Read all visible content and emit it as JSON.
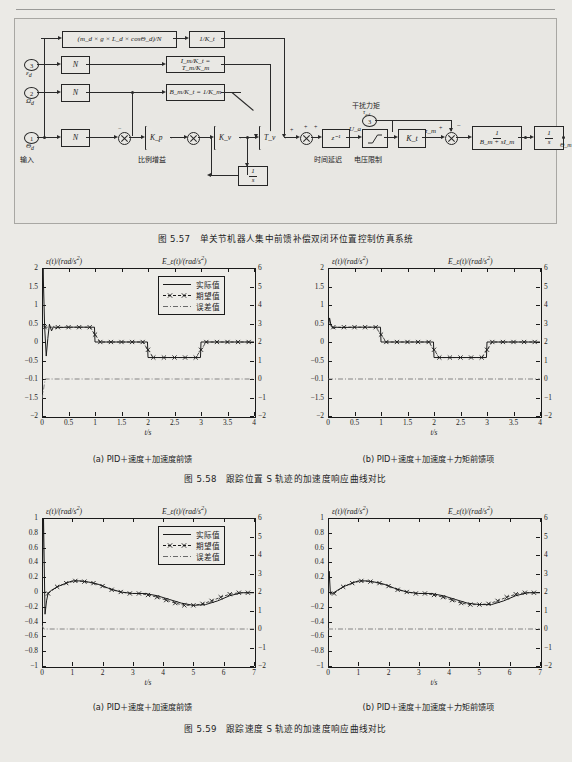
{
  "page": {
    "background": "#ebeae6",
    "ink": "#1d1d1d"
  },
  "block_diagram": {
    "caption": "图 5.57　单关节机器人集中前馈补偿双闭环位置控制仿真系统",
    "ports": [
      {
        "id": "3",
        "label": "ε_d"
      },
      {
        "id": "2",
        "label": "Ω_d"
      },
      {
        "id": "1",
        "label": "Θ_d"
      },
      {
        "id": "3b",
        "label": "τ_ed"
      },
      {
        "id": "1out",
        "label": "Θ"
      }
    ],
    "blocks": {
      "gravity": "(m_d × g × L_d × cosΘ_d)/N",
      "inv_kt_1": "1/K_t",
      "gear_n_1": "N",
      "gear_n_2": "N",
      "gear_n_3": "N",
      "inertia": "I_m/K_t = T_m/K_m",
      "damping": "B_m/K_t = 1/K_m",
      "delay": "z⁻¹",
      "saturation": "voltage-limit",
      "torque_const": "K_t",
      "motor_plant_num": "1",
      "motor_plant_den": "B_m + sI_m",
      "integrator_num": "1",
      "integrator_den": "s",
      "inner_integ_num": "1",
      "inner_integ_den": "s",
      "output_gear": "1/N",
      "gain_kp": "K_p",
      "gain_kv": "K_v",
      "gain_tv": "T_v"
    },
    "signal_labels": {
      "ua": "U_a",
      "tau_m": "τ_m",
      "theta_m": "Θ_m"
    },
    "annotations": {
      "proportional_gain": "比例增益",
      "time_delay": "时间延迟",
      "voltage_limit": "电压限制",
      "disturbance_torque": "干扰力矩",
      "input": "输入",
      "output": "输出"
    },
    "signs": {
      "plus": "+",
      "minus": "−"
    }
  },
  "figure_558": {
    "caption": "图 5.58　跟踪位置 S 轨迹的加速度响应曲线对比",
    "subcaptions": {
      "a": "(a) PID＋速度＋加速度前馈",
      "b": "(b) PID＋速度＋加速度＋力矩前馈项"
    },
    "legend": [
      "实际值",
      "期望值",
      "误差值"
    ]
  },
  "figure_559": {
    "caption": "图 5.59　跟踪速度 S 轨迹的加速度响应曲线对比",
    "subcaptions": {
      "a": "(a) PID＋速度＋加速度前馈",
      "b": "(b) PID＋速度＋加速度＋力矩前馈项"
    },
    "legend": [
      "实际值",
      "期望值",
      "误差值"
    ]
  },
  "chart_data": [
    {
      "id": "fig558a",
      "type": "line",
      "title": "(a) PID＋速度＋加速度前馈",
      "xlabel": "t/s",
      "ylabel": "ε(t)/(rad/s²)",
      "ylabel_right": "E_ε(t)/(rad/s²)",
      "xlim": [
        0,
        4
      ],
      "ylim": [
        -2,
        2
      ],
      "ylim_right": [
        -2,
        6
      ],
      "xticks": [
        0,
        0.5,
        1,
        1.5,
        2,
        2.5,
        3,
        3.5,
        4
      ],
      "xticklabels": [
        "0",
        "0.5",
        "1",
        "1.5",
        "2",
        "2.5",
        "3",
        "3.5",
        "4"
      ],
      "yticks": [
        -2,
        -1.5,
        -1,
        -0.5,
        0,
        0.5,
        1,
        1.5,
        2
      ],
      "yticklabels": [
        "−2",
        "−1.5",
        "−0.1",
        "−0.5",
        "0",
        "0.5",
        "1",
        "1.5",
        "2"
      ],
      "yticks_right": [
        -2,
        -1,
        0,
        1,
        2,
        3,
        4,
        5,
        6
      ],
      "yticklabels_right": [
        "−2",
        "−1",
        "0",
        "1",
        "2",
        "3",
        "4",
        "5",
        "6"
      ],
      "grid": false,
      "legend": [
        "实际值",
        "期望值",
        "误差值"
      ],
      "legend_position": "upper right",
      "series": [
        {
          "name": "实际值",
          "style": "solid",
          "x": [
            0,
            0.02,
            0.05,
            0.08,
            0.11,
            0.14,
            0.18,
            0.22,
            0.26,
            0.3,
            0.36,
            0.45,
            0.6,
            0.99,
            1.0,
            1.99,
            2.0,
            2.99,
            3.0,
            4.0
          ],
          "y": [
            0.38,
            2.0,
            0.4,
            -0.38,
            0.1,
            0.48,
            0.3,
            0.42,
            0.37,
            0.4,
            0.39,
            0.4,
            0.4,
            0.4,
            0.0,
            0.0,
            -0.42,
            -0.42,
            0.0,
            0.0
          ]
        },
        {
          "name": "期望值",
          "style": "dashed-marker",
          "x": [
            0.05,
            0.3,
            0.5,
            0.7,
            0.9,
            1.0,
            1.1,
            1.3,
            1.5,
            1.7,
            1.9,
            2.0,
            2.1,
            2.3,
            2.5,
            2.7,
            2.9,
            3.0,
            3.1,
            3.3,
            3.5,
            3.7,
            3.9
          ],
          "y": [
            0.4,
            0.4,
            0.4,
            0.4,
            0.4,
            0.2,
            0.0,
            0.0,
            0.0,
            0.0,
            0.0,
            -0.21,
            -0.42,
            -0.42,
            -0.42,
            -0.42,
            -0.42,
            -0.21,
            0.0,
            0.0,
            0.0,
            0.0,
            0.0
          ]
        },
        {
          "name": "误差值",
          "style": "dashdot",
          "x": [
            0,
            0.06,
            0.12,
            4.0
          ],
          "y": [
            -1.55,
            -1.0,
            -1.0,
            -1.0
          ]
        }
      ]
    },
    {
      "id": "fig558b",
      "type": "line",
      "title": "(b) PID＋速度＋加速度＋力矩前馈项",
      "xlabel": "t/s",
      "ylabel": "ε(t)/(rad/s²)",
      "ylabel_right": "E_ε(t)/(rad/s²)",
      "xlim": [
        0,
        4
      ],
      "ylim": [
        -2,
        2
      ],
      "ylim_right": [
        -2,
        6
      ],
      "xticks": [
        0,
        0.5,
        1,
        1.5,
        2,
        2.5,
        3,
        3.5,
        4
      ],
      "xticklabels": [
        "0",
        "0.5",
        "1",
        "1.5",
        "2",
        "2.5",
        "3",
        "3.5",
        "4"
      ],
      "yticks": [
        -2,
        -1.5,
        -1,
        -0.5,
        0,
        0.5,
        1,
        1.5,
        2
      ],
      "yticklabels": [
        "−2",
        "−1.5",
        "−0.1",
        "−0.5",
        "0",
        "0.5",
        "1",
        "1.5",
        "2"
      ],
      "yticks_right": [
        -2,
        -1,
        0,
        1,
        2,
        3,
        4,
        5,
        6
      ],
      "yticklabels_right": [
        "−2",
        "−1",
        "0",
        "1",
        "2",
        "3",
        "4",
        "5",
        "6"
      ],
      "grid": false,
      "legend": [],
      "series": [
        {
          "name": "实际值",
          "style": "solid",
          "x": [
            0,
            0.03,
            0.06,
            0.1,
            0.15,
            0.25,
            0.5,
            0.99,
            1.0,
            1.99,
            2.0,
            2.99,
            3.0,
            4.0
          ],
          "y": [
            0.35,
            0.65,
            0.42,
            0.37,
            0.4,
            0.39,
            0.4,
            0.4,
            0.0,
            0.0,
            -0.42,
            -0.42,
            0.0,
            0.0
          ]
        },
        {
          "name": "期望值",
          "style": "dashed-marker",
          "x": [
            0.1,
            0.3,
            0.5,
            0.7,
            0.9,
            1.0,
            1.1,
            1.3,
            1.5,
            1.7,
            1.9,
            2.0,
            2.1,
            2.3,
            2.5,
            2.7,
            2.9,
            3.0,
            3.1,
            3.3,
            3.5,
            3.7,
            3.9
          ],
          "y": [
            0.4,
            0.4,
            0.4,
            0.4,
            0.4,
            0.2,
            0.0,
            0.0,
            0.0,
            0.0,
            0.0,
            -0.21,
            -0.42,
            -0.42,
            -0.42,
            -0.42,
            -0.42,
            -0.21,
            0.0,
            0.0,
            0.0,
            0.0,
            0.0
          ]
        },
        {
          "name": "误差值",
          "style": "dashdot",
          "x": [
            0,
            0.05,
            4.0
          ],
          "y": [
            -1.0,
            -1.0,
            -1.0
          ]
        }
      ]
    },
    {
      "id": "fig559a",
      "type": "line",
      "title": "(a) PID＋速度＋加速度前馈",
      "xlabel": "t/s",
      "ylabel": "ε(t)/(rad/s²)",
      "ylabel_right": "E_ε(t)/(rad/s²)",
      "xlim": [
        0,
        7
      ],
      "ylim": [
        -1,
        1
      ],
      "ylim_right": [
        -2,
        6
      ],
      "xticks": [
        0,
        1,
        2,
        3,
        4,
        5,
        6,
        7
      ],
      "xticklabels": [
        "0",
        "1",
        "2",
        "3",
        "4",
        "5",
        "6",
        "7"
      ],
      "yticks": [
        -1,
        -0.8,
        -0.6,
        -0.4,
        -0.2,
        0,
        0.2,
        0.4,
        0.6,
        0.8,
        1
      ],
      "yticklabels": [
        "−1",
        "−0.8",
        "−0.6",
        "−0.4",
        "−0.2",
        "0",
        "0.2",
        "0.4",
        "0.6",
        "0.8",
        "1"
      ],
      "yticks_right": [
        -2,
        -1,
        0,
        1,
        2,
        3,
        4,
        5,
        6
      ],
      "yticklabels_right": [
        "−2",
        "−1",
        "0",
        "1",
        "2",
        "3",
        "4",
        "5",
        "6"
      ],
      "grid": false,
      "legend": [
        "实际值",
        "期望值",
        "误差值"
      ],
      "legend_position": "upper right",
      "series": [
        {
          "name": "实际值",
          "style": "solid",
          "x": [
            0,
            0.05,
            0.1,
            0.15,
            0.2,
            0.3,
            0.5,
            0.8,
            1.0,
            1.3,
            1.6,
            1.9,
            2.2,
            2.6,
            3.0,
            3.4,
            3.8,
            4.2,
            4.6,
            5.0,
            5.4,
            5.8,
            6.2,
            6.6,
            7.0
          ],
          "y": [
            0.0,
            1.0,
            -0.3,
            -0.12,
            -0.02,
            0.02,
            0.07,
            0.12,
            0.15,
            0.15,
            0.13,
            0.1,
            0.05,
            0.0,
            -0.02,
            -0.02,
            -0.05,
            -0.1,
            -0.15,
            -0.18,
            -0.17,
            -0.12,
            -0.05,
            -0.01,
            -0.01
          ]
        },
        {
          "name": "期望值",
          "style": "dashed-marker",
          "x": [
            0.2,
            0.5,
            0.8,
            1.1,
            1.4,
            1.7,
            2.0,
            2.3,
            2.6,
            2.9,
            3.2,
            3.5,
            3.8,
            4.1,
            4.4,
            4.7,
            5.0,
            5.3,
            5.6,
            5.9,
            6.2,
            6.5,
            6.8
          ],
          "y": [
            -0.02,
            0.07,
            0.12,
            0.15,
            0.14,
            0.12,
            0.08,
            0.03,
            0.0,
            -0.02,
            -0.02,
            -0.04,
            -0.07,
            -0.11,
            -0.15,
            -0.18,
            -0.18,
            -0.16,
            -0.12,
            -0.07,
            -0.03,
            -0.01,
            -0.01
          ]
        },
        {
          "name": "误差值",
          "style": "dashdot",
          "x": [
            0,
            0.06,
            7.0
          ],
          "y": [
            -0.45,
            -0.5,
            -0.5
          ]
        }
      ]
    },
    {
      "id": "fig559b",
      "type": "line",
      "title": "(b) PID＋速度＋加速度＋力矩前馈项",
      "xlabel": "t/s",
      "ylabel": "ε(t)/(rad/s²)",
      "ylabel_right": "E_ε(t)/(rad/s²)",
      "xlim": [
        0,
        7
      ],
      "ylim": [
        -1,
        1
      ],
      "ylim_right": [
        -2,
        6
      ],
      "xticks": [
        0,
        1,
        2,
        3,
        4,
        5,
        6,
        7
      ],
      "xticklabels": [
        "0",
        "1",
        "2",
        "3",
        "4",
        "5",
        "6",
        "7"
      ],
      "yticks": [
        -1,
        -0.8,
        -0.6,
        -0.4,
        -0.2,
        0,
        0.2,
        0.4,
        0.6,
        0.8,
        1
      ],
      "yticklabels": [
        "−1",
        "−0.8",
        "−0.6",
        "−0.4",
        "−0.2",
        "0",
        "0.2",
        "0.4",
        "0.6",
        "0.8",
        "1"
      ],
      "yticks_right": [
        -2,
        -1,
        0,
        1,
        2,
        3,
        4,
        5,
        6
      ],
      "yticklabels_right": [
        "−2",
        "−1",
        "0",
        "1",
        "2",
        "3",
        "4",
        "5",
        "6"
      ],
      "grid": false,
      "legend": [],
      "series": [
        {
          "name": "实际值",
          "style": "solid",
          "x": [
            0,
            0.04,
            0.08,
            0.15,
            0.3,
            0.5,
            0.8,
            1.0,
            1.3,
            1.6,
            1.9,
            2.2,
            2.6,
            3.0,
            3.4,
            3.8,
            4.2,
            4.6,
            5.0,
            5.4,
            5.8,
            6.2,
            6.6,
            7.0
          ],
          "y": [
            -0.02,
            0.28,
            -0.03,
            -0.02,
            0.02,
            0.07,
            0.12,
            0.15,
            0.15,
            0.13,
            0.1,
            0.05,
            0.0,
            -0.02,
            -0.02,
            -0.05,
            -0.1,
            -0.15,
            -0.17,
            -0.17,
            -0.12,
            -0.05,
            -0.01,
            -0.01
          ]
        },
        {
          "name": "期望值",
          "style": "dashed-marker",
          "x": [
            0.2,
            0.5,
            0.8,
            1.1,
            1.4,
            1.7,
            2.0,
            2.3,
            2.6,
            2.9,
            3.2,
            3.5,
            3.8,
            4.1,
            4.4,
            4.7,
            5.0,
            5.3,
            5.6,
            5.9,
            6.2,
            6.5,
            6.8
          ],
          "y": [
            -0.02,
            0.07,
            0.12,
            0.15,
            0.14,
            0.12,
            0.08,
            0.03,
            0.0,
            -0.02,
            -0.02,
            -0.04,
            -0.07,
            -0.11,
            -0.15,
            -0.17,
            -0.17,
            -0.16,
            -0.12,
            -0.07,
            -0.03,
            -0.01,
            -0.01
          ]
        },
        {
          "name": "误差值",
          "style": "dashdot",
          "x": [
            0,
            7.0
          ],
          "y": [
            -0.5,
            -0.5
          ]
        }
      ]
    }
  ]
}
